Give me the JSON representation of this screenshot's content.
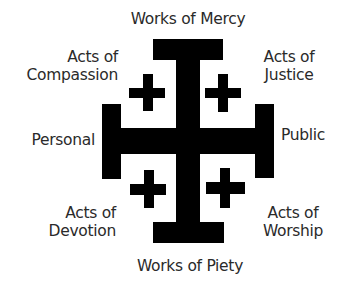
{
  "diagram": {
    "type": "jerusalem-cross",
    "color": "#000000",
    "labels": {
      "top": "Works of Mercy",
      "bottom": "Works of Piety",
      "left": "Personal",
      "right": "Public",
      "upper_left": {
        "line1": "Acts of",
        "line2": "Compassion"
      },
      "upper_right": {
        "line1": "Acts of",
        "line2": "Justice"
      },
      "lower_left": {
        "line1": "Acts of",
        "line2": "Devotion"
      },
      "lower_right": {
        "line1": "Acts of",
        "line2": "Worship"
      }
    }
  }
}
